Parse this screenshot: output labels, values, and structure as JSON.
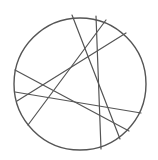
{
  "diagram": {
    "type": "circle-with-chords",
    "background": "#ffffff",
    "stroke_color": "#555555",
    "circle": {
      "cx": 80,
      "cy": 84,
      "r": 66
    },
    "chords": [
      {
        "id": "chord-1",
        "x1": 72,
        "y1": 15,
        "x2": 120,
        "y2": 139
      },
      {
        "id": "chord-2",
        "x1": 96,
        "y1": 16,
        "x2": 101,
        "y2": 149
      },
      {
        "id": "chord-3",
        "x1": 106,
        "y1": 20,
        "x2": 28,
        "y2": 125
      },
      {
        "id": "chord-4",
        "x1": 126,
        "y1": 33,
        "x2": 17,
        "y2": 101
      },
      {
        "id": "chord-5",
        "x1": 15,
        "y1": 70,
        "x2": 129,
        "y2": 131
      },
      {
        "id": "chord-6",
        "x1": 15,
        "y1": 92,
        "x2": 141,
        "y2": 113
      }
    ]
  }
}
